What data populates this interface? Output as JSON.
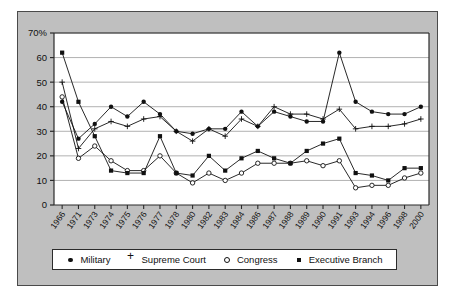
{
  "chart_data": {
    "type": "line",
    "title": "",
    "subtitle": "",
    "xlabel": "",
    "ylabel": "",
    "ylim": [
      0,
      70
    ],
    "ytick_values": [
      0,
      10,
      20,
      30,
      40,
      50,
      60,
      70
    ],
    "ytick_labels": [
      "0",
      "10",
      "20",
      "30",
      "40",
      "50",
      "60",
      "70%"
    ],
    "grid": "horizontal",
    "legend_position": "bottom",
    "categories": [
      "1966",
      "1971",
      "1973",
      "1974",
      "1975",
      "1976",
      "1977",
      "1978",
      "1980",
      "1982",
      "1983",
      "1984",
      "1986",
      "1987",
      "1988",
      "1989",
      "1990",
      "1991",
      "1993",
      "1994",
      "1996",
      "1998",
      "2000"
    ],
    "series": [
      {
        "name": "Military",
        "marker": "filled-circle",
        "color": "#111111",
        "values": [
          42,
          27,
          33,
          40,
          36,
          42,
          37,
          30,
          29,
          31,
          31,
          38,
          32,
          38,
          36,
          34,
          34,
          62,
          42,
          38,
          37,
          37,
          40
        ]
      },
      {
        "name": "Supreme Court",
        "marker": "plus",
        "color": "#111111",
        "values": [
          50,
          23,
          31,
          34,
          32,
          35,
          36,
          30,
          26,
          31,
          28,
          35,
          32,
          40,
          37,
          37,
          35,
          39,
          31,
          32,
          32,
          33,
          35
        ]
      },
      {
        "name": "Congress",
        "marker": "open-circle",
        "color": "#111111",
        "values": [
          44,
          19,
          24,
          18,
          14,
          14,
          20,
          13,
          9,
          13,
          10,
          13,
          17,
          17,
          17,
          18,
          16,
          18,
          7,
          8,
          8,
          11,
          13
        ]
      },
      {
        "name": "Executive Branch",
        "marker": "filled-square",
        "color": "#111111",
        "values": [
          62,
          42,
          28,
          14,
          13,
          13,
          28,
          13,
          12,
          20,
          14,
          19,
          22,
          19,
          17,
          22,
          25,
          27,
          13,
          12,
          10,
          15,
          15
        ]
      }
    ]
  },
  "legend": {
    "items": [
      {
        "label": "Military",
        "marker": "filled-circle"
      },
      {
        "label": "Supreme Court",
        "marker": "plus"
      },
      {
        "label": "Congress",
        "marker": "open-circle"
      },
      {
        "label": "Executive Branch",
        "marker": "filled-square"
      }
    ]
  },
  "colors": {
    "plate_background": "#bfbfbf",
    "plot_background": "#ffffff",
    "axis": "#2b2b2b",
    "gridline": "#8f8f8f",
    "ink": "#111111"
  }
}
